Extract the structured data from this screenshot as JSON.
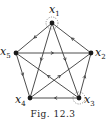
{
  "figure": {
    "caption": "Fig. 12.3",
    "colors": {
      "ink": "#1a1a1a",
      "edge": "#3a3a3a"
    }
  },
  "nodes": [
    {
      "id": "x1",
      "label": "x",
      "sub": "1",
      "x": 52,
      "y": 23,
      "dotted_circle": true
    },
    {
      "id": "x2",
      "label": "x",
      "sub": "2",
      "x": 91,
      "y": 53,
      "dotted_circle": false
    },
    {
      "id": "x3",
      "label": "x",
      "sub": "3",
      "x": 79,
      "y": 98,
      "dotted_circle": true
    },
    {
      "id": "x4",
      "label": "x",
      "sub": "4",
      "x": 30,
      "y": 98,
      "dotted_circle": false
    },
    {
      "id": "x5",
      "label": "x",
      "sub": "5",
      "x": 16,
      "y": 53,
      "dotted_circle": false
    }
  ],
  "edges": [
    {
      "from": "x1",
      "to": "x5"
    },
    {
      "from": "x2",
      "to": "x1"
    },
    {
      "from": "x5",
      "to": "x2"
    },
    {
      "from": "x5",
      "to": "x4"
    },
    {
      "from": "x3",
      "to": "x2"
    },
    {
      "from": "x3",
      "to": "x4"
    },
    {
      "from": "x1",
      "to": "x4"
    },
    {
      "from": "x1",
      "to": "x3"
    },
    {
      "from": "x4",
      "to": "x2"
    },
    {
      "from": "x3",
      "to": "x5"
    }
  ]
}
